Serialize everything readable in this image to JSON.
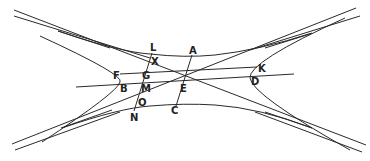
{
  "diagram": {
    "type": "hyperbola-conjugate-diameters",
    "stroke_color": "#2a2a2a",
    "background": "#ffffff",
    "labels": [
      {
        "id": "L",
        "text": "L",
        "x": 150,
        "y": 43
      },
      {
        "id": "A",
        "text": "A",
        "x": 189,
        "y": 46
      },
      {
        "id": "X",
        "text": "X",
        "x": 151,
        "y": 57
      },
      {
        "id": "K",
        "text": "K",
        "x": 258,
        "y": 64
      },
      {
        "id": "F",
        "text": "F",
        "x": 113,
        "y": 71
      },
      {
        "id": "G",
        "text": "G",
        "x": 142,
        "y": 71
      },
      {
        "id": "D",
        "text": "D",
        "x": 251,
        "y": 77
      },
      {
        "id": "B",
        "text": "B",
        "x": 120,
        "y": 84
      },
      {
        "id": "M",
        "text": "M",
        "x": 141,
        "y": 84
      },
      {
        "id": "E",
        "text": "E",
        "x": 180,
        "y": 84
      },
      {
        "id": "O",
        "text": "O",
        "x": 138,
        "y": 98
      },
      {
        "id": "C",
        "text": "C",
        "x": 171,
        "y": 106
      },
      {
        "id": "N",
        "text": "N",
        "x": 130,
        "y": 113
      }
    ]
  }
}
